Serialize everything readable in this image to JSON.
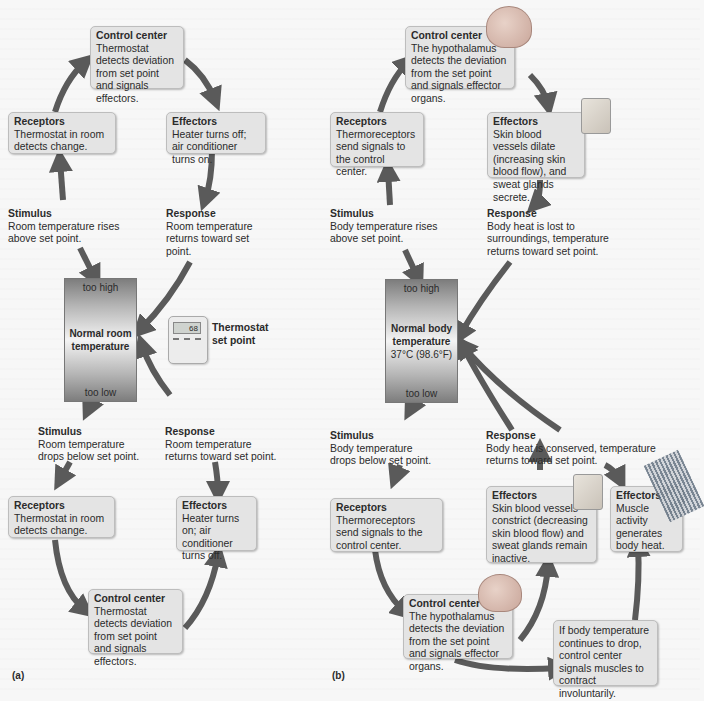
{
  "panel_a": {
    "label": "(a)",
    "top_loop": {
      "control_center": {
        "title": "Control center",
        "text": "Thermostat detects deviation from set point and signals effectors."
      },
      "receptors": {
        "title": "Receptors",
        "text": "Thermostat in room detects change."
      },
      "effectors": {
        "title": "Effectors",
        "text": "Heater turns off; air conditioner turns on."
      },
      "stimulus": {
        "title": "Stimulus",
        "text": "Room temperature rises above set point."
      },
      "response": {
        "title": "Response",
        "text": "Room temperature returns toward set point."
      }
    },
    "gauge": {
      "high": "too high",
      "center_line1": "Normal room",
      "center_line2": "temperature",
      "low": "too low"
    },
    "thermostat": {
      "display": "68",
      "label_line1": "Thermostat",
      "label_line2": "set point"
    },
    "bottom_loop": {
      "stimulus": {
        "title": "Stimulus",
        "text": "Room temperature drops below set point."
      },
      "response": {
        "title": "Response",
        "text": "Room temperature returns toward set point."
      },
      "receptors": {
        "title": "Receptors",
        "text": "Thermostat in room detects change."
      },
      "effectors": {
        "title": "Effectors",
        "text": "Heater turns on; air conditioner turns off."
      },
      "control_center": {
        "title": "Control center",
        "text": "Thermostat detects deviation from set point and signals effectors."
      }
    }
  },
  "panel_b": {
    "label": "(b)",
    "top_loop": {
      "control_center": {
        "title": "Control center",
        "text": "The hypothalamus detects the deviation from the set point and signals effector organs."
      },
      "receptors": {
        "title": "Receptors",
        "text": "Thermoreceptors send signals to the control center."
      },
      "effectors": {
        "title": "Effectors",
        "text": "Skin blood vessels dilate (increasing skin blood flow), and sweat glands secrete."
      },
      "stimulus": {
        "title": "Stimulus",
        "text": "Body temperature rises above set point."
      },
      "response": {
        "title": "Response",
        "text": "Body heat is lost to surroundings, temperature returns toward set point."
      }
    },
    "gauge": {
      "high": "too high",
      "center_line1": "Normal body",
      "center_line2": "temperature",
      "value": "37°C (98.6°F)",
      "low": "too low"
    },
    "bottom_loop": {
      "stimulus": {
        "title": "Stimulus",
        "text": "Body temperature drops below set point."
      },
      "response": {
        "title": "Response",
        "text": "Body heat is conserved, temperature returns toward set point."
      },
      "receptors": {
        "title": "Receptors",
        "text": "Thermoreceptors send signals to the control center."
      },
      "effectors_skin": {
        "title": "Effectors",
        "text": "Skin blood vessels constrict (decreasing skin blood flow) and sweat glands remain inactive."
      },
      "effectors_muscle": {
        "title": "Effectors",
        "text": "Muscle activity generates body heat."
      },
      "control_center": {
        "title": "Control center",
        "text": "The hypothalamus detects the deviation from the set point and signals effector organs."
      },
      "shivering_note": {
        "text": "If body temperature continues to drop, control center signals muscles to contract involuntarily."
      }
    }
  },
  "colors": {
    "arrow": "#5a5a5a",
    "box": "#e4e4e4",
    "box_border": "#bdbdbd"
  }
}
